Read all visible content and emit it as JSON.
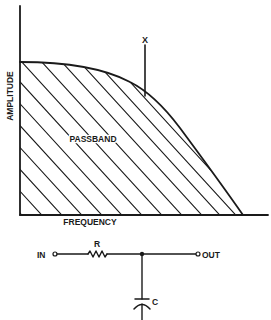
{
  "figure": {
    "graph": {
      "y_axis_label": "AMPLITUDE",
      "x_axis_label": "FREQUENCY",
      "region_label": "PASSBAND",
      "marker_label": "X"
    },
    "circuit": {
      "input_label": "IN",
      "output_label": "OUT",
      "resistor_label": "R",
      "capacitor_label": "C"
    }
  },
  "colors": {
    "ink": "#1a1a1a",
    "background": "#ffffff"
  }
}
